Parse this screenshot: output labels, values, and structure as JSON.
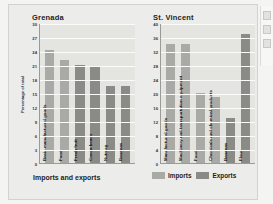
{
  "chart_data": [
    {
      "type": "bar",
      "title": "Grenada",
      "xlabel": "Imports and exports",
      "ylabel": "Percentage of total",
      "ylim": [
        0,
        30
      ],
      "yticks": [
        0,
        3,
        6,
        9,
        12,
        15,
        18,
        21,
        24,
        27,
        30
      ],
      "grid": true,
      "legend_position": "bottom",
      "categories": [
        "Basic manufactured goods",
        "Food",
        "Fresh fruit",
        "Cocoa beans",
        "Nutmeg",
        "Bananas"
      ],
      "series_of": [
        "Imports",
        "Imports",
        "Exports",
        "Exports",
        "Exports",
        "Exports"
      ],
      "values": [
        24.3,
        22.0,
        21.0,
        20.7,
        16.5,
        16.5
      ]
    },
    {
      "type": "bar",
      "title": "St. Vincent",
      "xlabel": "",
      "ylabel": "",
      "ylim": [
        0,
        40
      ],
      "yticks": [
        0,
        4,
        8,
        12,
        16,
        20,
        24,
        28,
        32,
        36,
        40
      ],
      "grid": true,
      "legend_position": "bottom",
      "categories": [
        "Manufactured goods",
        "Machinery and transportation equipment",
        "Food",
        "Chemicals and chemical products",
        "Bananas",
        "Flour"
      ],
      "series_of": [
        "Imports",
        "Imports",
        "Imports",
        "Imports",
        "Exports",
        "Exports"
      ],
      "values": [
        34.0,
        34.0,
        20.0,
        19.0,
        13.0,
        37.0
      ]
    }
  ],
  "panels": {
    "left": {
      "title": "Grenada",
      "ylabel": "Percentage of total",
      "footer": "Imports and exports",
      "yticks": [
        "30",
        "27",
        "24",
        "21",
        "18",
        "15",
        "12",
        "9",
        "6",
        "3",
        "0"
      ],
      "bars": [
        {
          "label": "Basic manufactured goods",
          "value": 24.3,
          "series": "imports"
        },
        {
          "label": "Food",
          "value": 22.0,
          "series": "imports"
        },
        {
          "label": "Fresh fruit",
          "value": 21.0,
          "series": "exports"
        },
        {
          "label": "Cocoa beans",
          "value": 20.7,
          "series": "exports"
        },
        {
          "label": "Nutmeg",
          "value": 16.5,
          "series": "exports"
        },
        {
          "label": "Bananas",
          "value": 16.5,
          "series": "exports"
        }
      ]
    },
    "right": {
      "title": "St. Vincent",
      "yticks": [
        "40",
        "36",
        "32",
        "28",
        "24",
        "20",
        "16",
        "12",
        "8",
        "4",
        "0"
      ],
      "bars": [
        {
          "label": "Manufactured goods",
          "value": 34.0,
          "series": "imports"
        },
        {
          "label": "Machinery and transportation equipment",
          "value": 34.0,
          "series": "imports"
        },
        {
          "label": "Food",
          "value": 20.0,
          "series": "imports"
        },
        {
          "label": "Chemicals and chemical products",
          "value": 19.0,
          "series": "imports"
        },
        {
          "label": "Bananas",
          "value": 13.0,
          "series": "exports"
        },
        {
          "label": "Flour",
          "value": 37.0,
          "series": "exports"
        }
      ]
    }
  },
  "legend": {
    "imports_label": "Imports",
    "exports_label": "Exports"
  },
  "colors": {
    "imports": "#a9a9a6",
    "exports": "#8a8a87",
    "plot_background": "#e4e4e1",
    "figure_background": "#ececea",
    "gridline": "#fbfbfa",
    "axis": "#9a9a96"
  }
}
